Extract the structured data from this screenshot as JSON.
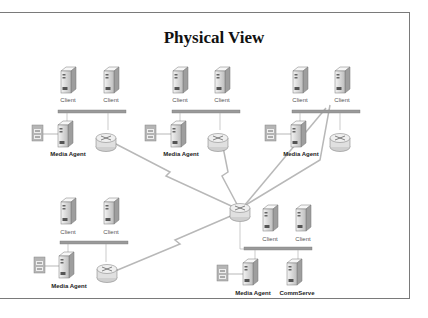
{
  "title": "Physical View",
  "labels": {
    "client": "Client",
    "media_agent": "Media Agent",
    "commserve": "CommServe"
  },
  "sites": [
    {
      "name": "site-top-left",
      "clients": [
        "Client",
        "Client"
      ],
      "media_agent": "Media Agent"
    },
    {
      "name": "site-top-center",
      "clients": [
        "Client",
        "Client"
      ],
      "media_agent": "Media Agent"
    },
    {
      "name": "site-top-right",
      "clients": [
        "Client",
        "Client"
      ],
      "media_agent": "Media Agent"
    },
    {
      "name": "site-bottom-left",
      "clients": [
        "Client",
        "Client"
      ],
      "media_agent": "Media Agent"
    },
    {
      "name": "site-bottom-right",
      "clients": [
        "Client",
        "Client"
      ],
      "media_agent": "Media Agent",
      "commserve": "CommServe"
    }
  ],
  "colors": {
    "frame": "#7a7a7a",
    "bus": "#9a9a9a",
    "server": "#e6e6e6",
    "wan_link": "#b8b8b8"
  }
}
